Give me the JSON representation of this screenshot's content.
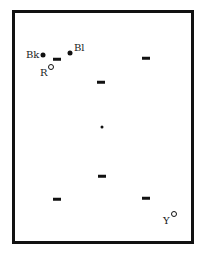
{
  "diagram": {
    "frame": {
      "left": 12,
      "top": 10,
      "right": 194,
      "bottom": 244
    },
    "labeled_points": [
      {
        "label": "Bk",
        "marker": "filled-dot",
        "x": 43,
        "y": 55,
        "label_x": 26,
        "label_y": 50
      },
      {
        "label": "Bl",
        "marker": "filled-dot",
        "x": 70,
        "y": 53,
        "label_x": 74,
        "label_y": 43
      },
      {
        "label": "R",
        "marker": "open-circle",
        "x": 51,
        "y": 67,
        "label_x": 40,
        "label_y": 68
      },
      {
        "label": "Y",
        "marker": "open-circle",
        "x": 174,
        "y": 214,
        "label_x": 163,
        "label_y": 216
      }
    ],
    "dashes": [
      {
        "x": 57,
        "y": 59
      },
      {
        "x": 146,
        "y": 58
      },
      {
        "x": 101,
        "y": 82
      },
      {
        "x": 102,
        "y": 176
      },
      {
        "x": 57,
        "y": 199
      },
      {
        "x": 146,
        "y": 198
      }
    ],
    "center_point": {
      "marker": "small-dot",
      "x": 102,
      "y": 127
    }
  }
}
